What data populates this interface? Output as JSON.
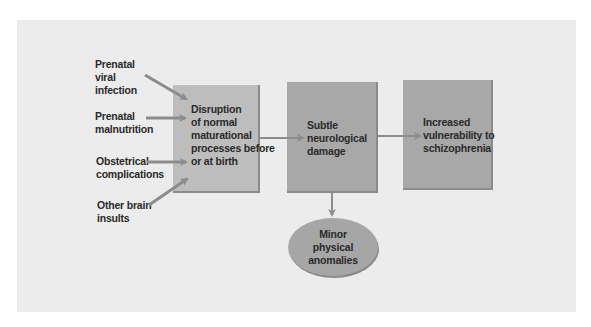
{
  "diagram": {
    "causes": [
      {
        "lines": [
          "Prenatal",
          "viral",
          "infection"
        ]
      },
      {
        "lines": [
          "Prenatal",
          "malnutrition"
        ]
      },
      {
        "lines": [
          "Obstetrical",
          "complications"
        ]
      },
      {
        "lines": [
          "Other brain",
          "insults"
        ]
      }
    ],
    "boxes": [
      {
        "lines": [
          "Disruption",
          "of normal",
          "maturational",
          "processes before",
          "or at birth"
        ]
      },
      {
        "lines": [
          "Subtle",
          "neurological",
          "damage"
        ]
      },
      {
        "lines": [
          "Increased",
          "vulnerability to",
          "schizophrenia"
        ]
      }
    ],
    "outcome": {
      "lines": [
        "Minor",
        "physical",
        "anomalies"
      ]
    },
    "colors": {
      "panel": "#ececec",
      "box_light": "#bdbdbd",
      "box": "#a8a8a8",
      "arrow": "#8c8c8c",
      "text": "#2a2a2a"
    }
  }
}
